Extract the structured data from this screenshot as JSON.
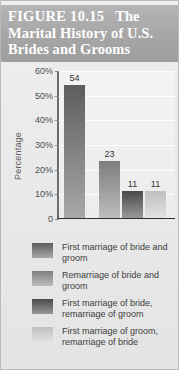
{
  "figure": {
    "number_label": "FIGURE 10.15",
    "title_rest": "The",
    "title_line2": "Marital History of U.S.",
    "title_line3": "Brides and Grooms",
    "banner_color": "#a6a6a6",
    "banner_text_color": "#ffffff"
  },
  "chart_data": {
    "type": "bar",
    "title": "The Marital History of U.S. Brides and Grooms",
    "categories": [
      "First marriage of bride and groom",
      "Remarriage of bride and groom",
      "First marriage of bride, remarriage of groom",
      "First marriage of groom, remarriage of bride"
    ],
    "values": [
      54,
      23,
      11,
      11
    ],
    "value_labels": [
      "54",
      "23",
      "11",
      "11"
    ],
    "xlabel": "",
    "ylabel": "Percentage",
    "ylim": [
      0,
      60
    ],
    "yticks": [
      0,
      10,
      20,
      30,
      40,
      50,
      60
    ],
    "ytick_labels": [
      "0",
      "10%",
      "20%",
      "30%",
      "40%",
      "50%",
      "60%"
    ],
    "grid": true,
    "legend_position": "below",
    "bar_colors": [
      "#6e6e6e",
      "#8d8d8d",
      "#575757",
      "#c8c8c8"
    ],
    "series": [
      {
        "name": "Percentage of U.S. marriages",
        "values": [
          54,
          23,
          11,
          11
        ]
      }
    ]
  },
  "legend": {
    "entries": [
      {
        "label": "First marriage of bride and groom",
        "color_top": "#5d5d5d",
        "color_bottom": "#a8a8a8"
      },
      {
        "label": "Remarriage of bride and groom",
        "color_top": "#7e7e7e",
        "color_bottom": "#bdbdbd"
      },
      {
        "label": "First marriage of bride, remarriage of groom",
        "color_top": "#4a4a4a",
        "color_bottom": "#989898"
      },
      {
        "label": "First marriage of groom, remarriage of bride",
        "color_top": "#bfbfbf",
        "color_bottom": "#e2e2e2"
      }
    ]
  }
}
